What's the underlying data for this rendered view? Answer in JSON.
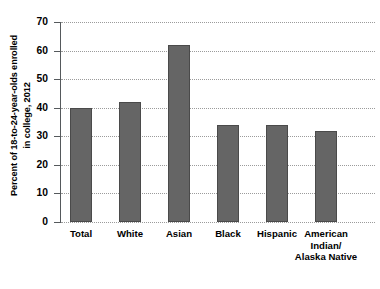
{
  "chart_data": {
    "type": "bar",
    "title": "",
    "subtitle": "",
    "xlabel": "",
    "ylabel": "Percent of 18-to-24-year-olds enrolled in college, 2012",
    "ylabel_lines": [
      "Percent of 18-to-24-year-olds enrolled",
      "in college, 2012"
    ],
    "categories": [
      "Total",
      "White",
      "Asian",
      "Black",
      "Hispanic",
      "American Indian/Alaska Native"
    ],
    "category_lines": [
      [
        "Total"
      ],
      [
        "White"
      ],
      [
        "Asian"
      ],
      [
        "Black"
      ],
      [
        "Hispanic"
      ],
      [
        "American",
        "Indian/",
        "Alaska Native"
      ]
    ],
    "values": [
      40,
      42,
      62,
      34,
      34,
      32
    ],
    "ylim": [
      0,
      70
    ],
    "yticks": [
      0,
      10,
      20,
      30,
      40,
      50,
      60,
      70
    ],
    "ytick_labels": [
      "0",
      "10",
      "20",
      "30",
      "40",
      "50",
      "60",
      "70"
    ],
    "grid": true,
    "grid_axis": "y",
    "legend": false,
    "legend_position": "none",
    "bar_color": "#656565",
    "bar_edge_color": "#4a4a4a",
    "grid_color": "#9b9b9b",
    "axis_color": "#55595c",
    "background_color": "#ffffff"
  }
}
